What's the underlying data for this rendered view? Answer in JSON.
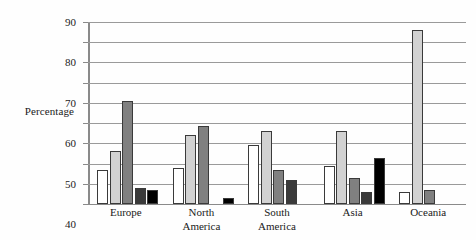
{
  "chart_data": {
    "type": "bar",
    "title": "",
    "xlabel": "",
    "ylabel": "Percentage",
    "ylim": [
      0,
      90
    ],
    "yticks": [
      0,
      10,
      20,
      30,
      40,
      50,
      60,
      70,
      80,
      90
    ],
    "ytick_labels": [
      "0",
      "10",
      "20",
      "30",
      "40",
      "50",
      "60",
      "70",
      "80",
      "90"
    ],
    "grid": true,
    "legend": "none",
    "categories": [
      "Europe",
      "North America",
      "South America",
      "Asia",
      "Oceania"
    ],
    "category_lines": [
      [
        "Europe"
      ],
      [
        "North",
        "America"
      ],
      [
        "South",
        "America"
      ],
      [
        "Asia"
      ],
      [
        "Oceania"
      ]
    ],
    "series": [
      {
        "name": "Series 1",
        "color": "#ffffff",
        "values": [
          17,
          18,
          29,
          19,
          6
        ]
      },
      {
        "name": "Series 2",
        "color": "#d2d2d2",
        "values": [
          26,
          34,
          36,
          36,
          86
        ]
      },
      {
        "name": "Series 3",
        "color": "#808080",
        "values": [
          51,
          38.5,
          17,
          13,
          7
        ]
      },
      {
        "name": "Series 4",
        "color": "#3a3a3a",
        "values": [
          8,
          0,
          12,
          6,
          0
        ]
      },
      {
        "name": "Series 5",
        "color": "#000000",
        "values": [
          7,
          3,
          0,
          23,
          0
        ]
      }
    ]
  },
  "colors": {
    "gridline": "#9a9a9a",
    "axis": "#8a8a8a",
    "bar_outline": "#3a3a3a",
    "background": "#fefefe",
    "text": "#1a1a1a"
  }
}
